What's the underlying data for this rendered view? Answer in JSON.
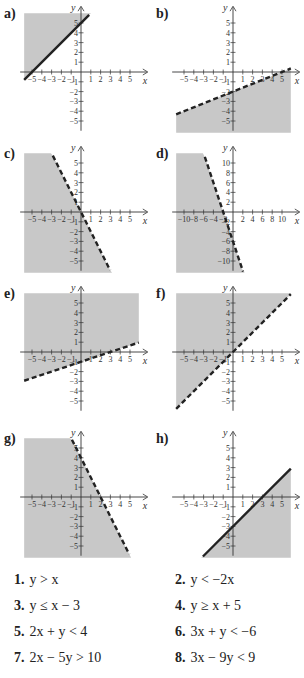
{
  "colors": {
    "shade": "#c8c8c8",
    "line": "#222222",
    "axis": "#333333",
    "background": "#ffffff"
  },
  "panels": [
    {
      "label": "a)",
      "line": "y = x + 5",
      "style": "solid",
      "shade": "above",
      "tick_step": 1,
      "x_ticks": [
        "-5",
        "-4",
        "-3",
        "-2",
        "-1",
        "1",
        "2",
        "3",
        "4",
        "5"
      ],
      "y_ticks": [
        "5",
        "4",
        "3",
        "2",
        "1",
        "-1",
        "-2",
        "-3",
        "-4",
        "-5"
      ],
      "slope": 1,
      "intercept": 5
    },
    {
      "label": "b)",
      "line": "y = 0.4x - 2",
      "style": "dashed",
      "shade": "below",
      "tick_step": 1,
      "x_ticks": [
        "-5",
        "-4",
        "-3",
        "-2",
        "-1",
        "1",
        "2",
        "3",
        "4",
        "5"
      ],
      "y_ticks": [
        "5",
        "4",
        "3",
        "2",
        "1",
        "-1",
        "-2",
        "-3",
        "-4",
        "-5"
      ],
      "slope": 0.4,
      "intercept": -2
    },
    {
      "label": "c)",
      "line": "y = -2x",
      "style": "dashed",
      "shade": "below",
      "tick_step": 1,
      "x_ticks": [
        "-5",
        "-4",
        "-3",
        "-2",
        "-1",
        "1",
        "2",
        "3",
        "4",
        "5"
      ],
      "y_ticks": [
        "5",
        "4",
        "3",
        "2",
        "1",
        "-1",
        "-2",
        "-3",
        "-4",
        "-5"
      ],
      "slope": -2,
      "intercept": 0
    },
    {
      "label": "d)",
      "line": "y = -3x - 6",
      "style": "dashed",
      "shade": "below",
      "tick_step": 2,
      "x_ticks": [
        "-10",
        "-8",
        "-6",
        "-4",
        "-2",
        "2",
        "4",
        "6",
        "8",
        "10"
      ],
      "y_ticks": [
        "10",
        "8",
        "6",
        "4",
        "2",
        "-2",
        "-4",
        "-6",
        "-8",
        "-10"
      ],
      "slope": -3,
      "intercept": -6
    },
    {
      "label": "e)",
      "line": "y = x/3 - 1",
      "style": "dashed",
      "shade": "above",
      "tick_step": 1,
      "x_ticks": [
        "-5",
        "-4",
        "-3",
        "-2",
        "-1",
        "1",
        "2",
        "3",
        "4",
        "5"
      ],
      "y_ticks": [
        "5",
        "4",
        "3",
        "2",
        "1",
        "-1",
        "-2",
        "-3",
        "-4",
        "-5"
      ],
      "slope": 0.3333,
      "intercept": -1
    },
    {
      "label": "f)",
      "line": "y = x",
      "style": "dashed",
      "shade": "above",
      "tick_step": 1,
      "x_ticks": [
        "-5",
        "-4",
        "-3",
        "-2",
        "-1",
        "1",
        "2",
        "3",
        "4",
        "5"
      ],
      "y_ticks": [
        "5",
        "4",
        "3",
        "2",
        "1",
        "-1",
        "-2",
        "-3",
        "-4",
        "-5"
      ],
      "slope": 1,
      "intercept": 0
    },
    {
      "label": "g)",
      "line": "y = -2x + 4",
      "style": "dashed",
      "shade": "below",
      "tick_step": 1,
      "x_ticks": [
        "-5",
        "-4",
        "-3",
        "-2",
        "-1",
        "1",
        "2",
        "3",
        "4",
        "5"
      ],
      "y_ticks": [
        "5",
        "4",
        "3",
        "2",
        "1",
        "-1",
        "-2",
        "-3",
        "-4",
        "-5"
      ],
      "slope": -2,
      "intercept": 4
    },
    {
      "label": "h)",
      "line": "y = x - 3",
      "style": "solid",
      "shade": "below",
      "tick_step": 1,
      "x_ticks": [
        "-5",
        "-4",
        "-3",
        "-2",
        "-1",
        "1",
        "2",
        "3",
        "4",
        "5"
      ],
      "y_ticks": [
        "5",
        "4",
        "3",
        "2",
        "1",
        "-1",
        "-2",
        "-3",
        "-4",
        "-5"
      ],
      "slope": 1,
      "intercept": -3
    }
  ],
  "axis_labels": {
    "x": "x",
    "y": "y"
  },
  "equations": [
    {
      "num": "1.",
      "expr": "y > x"
    },
    {
      "num": "2.",
      "expr": "y < −2x"
    },
    {
      "num": "3.",
      "expr": "y ≤ x − 3"
    },
    {
      "num": "4.",
      "expr": "y ≥ x + 5"
    },
    {
      "num": "5.",
      "expr": "2x + y < 4"
    },
    {
      "num": "6.",
      "expr": "3x + y < −6"
    },
    {
      "num": "7.",
      "expr": "2x − 5y > 10"
    },
    {
      "num": "8.",
      "expr": "3x − 9y < 9"
    }
  ]
}
